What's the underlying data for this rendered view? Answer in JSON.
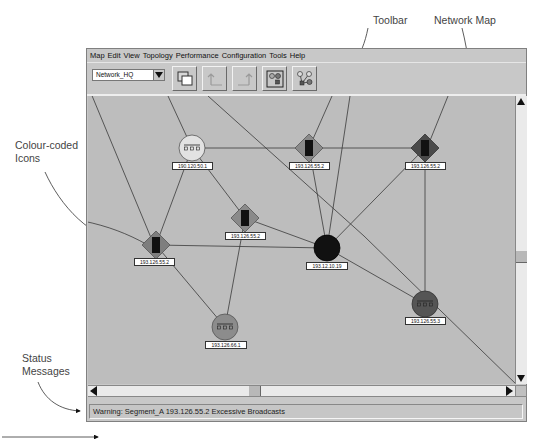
{
  "annotations": {
    "toolbar": "Toolbar",
    "network_map": "Network Map",
    "colour_coded_icons_line1": "Colour-coded",
    "colour_coded_icons_line2": "Icons",
    "status_messages_line1": "Status",
    "status_messages_line2": "Messages"
  },
  "menu": {
    "items": [
      "Map",
      "Edit",
      "View",
      "Topology",
      "Performance",
      "Configuration",
      "Tools",
      "Help"
    ]
  },
  "toolbar": {
    "map_select_value": "Network_HQ",
    "buttons": [
      {
        "name": "new-window",
        "icon": "overlapping-windows-icon",
        "enabled": true
      },
      {
        "name": "up-level",
        "icon": "up-left-arrow-icon",
        "enabled": false
      },
      {
        "name": "up-level-right",
        "icon": "up-right-arrow-icon",
        "enabled": false
      },
      {
        "name": "submap",
        "icon": "submap-icon",
        "enabled": true
      },
      {
        "name": "topology",
        "icon": "topology-icon",
        "enabled": true
      }
    ]
  },
  "map": {
    "nodes": [
      {
        "id": "n1",
        "type": "hub",
        "shape": "circle",
        "label": "190.120.50.1",
        "color": "#e2e2e2"
      },
      {
        "id": "n2",
        "type": "router",
        "shape": "diamond",
        "label": "193.126.55.2",
        "color": "#8a8a8a"
      },
      {
        "id": "n3",
        "type": "router",
        "shape": "diamond",
        "label": "193.126.55.2",
        "color": "#4a4a4a"
      },
      {
        "id": "n4",
        "type": "router",
        "shape": "diamond",
        "label": "193.126.55.2",
        "color": "#8a8a8a"
      },
      {
        "id": "n5",
        "type": "router",
        "shape": "diamond",
        "label": "193.126.55.2",
        "color": "#7e7e7e"
      },
      {
        "id": "n6",
        "type": "hub",
        "shape": "circle",
        "label": "193.12.10.19",
        "color": "#111111"
      },
      {
        "id": "n7",
        "type": "hub",
        "shape": "circle",
        "label": "193.126.55.3",
        "color": "#555555"
      },
      {
        "id": "n8",
        "type": "hub",
        "shape": "circle",
        "label": "193.126.66.1",
        "color": "#8c8c8c"
      }
    ]
  },
  "status": {
    "message": "Warning: Segment_A 193.126.55.2 Excessive Broadcasts"
  },
  "colors": {
    "map_background": "#bdbdbd",
    "window_background": "#c8c8c8",
    "link_color": "#3a3a3a"
  }
}
